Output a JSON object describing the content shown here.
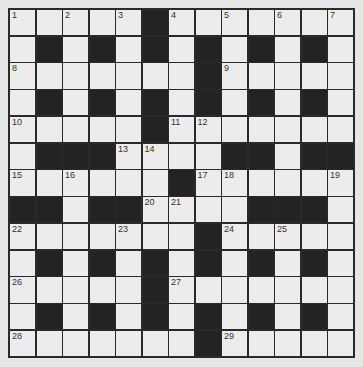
{
  "puzzle": {
    "rows": 13,
    "cols": 13,
    "colors": {
      "white": "#ececec",
      "black": "#232323",
      "border": "#2a2a2a",
      "background": "#e6e6e6"
    },
    "layout": [
      "WWWWWBWWWWWWW",
      "WBWBWBWBWBWBW",
      "WWWWWWWBWWWWW",
      "WBWBWBWBWBWBW",
      "WWWWWBWWWWWWW",
      "WBBBWWWWBBWBB",
      "WWWWWWBWWWWWW",
      "BBWBBWWWWBBBW",
      "WWWWWWWBWWWWW",
      "WBWBWBWBWBWBW",
      "WWWWWBWWWWWWW",
      "WBWBWBWBWBWBW",
      "WWWWWWWBWWWWW"
    ],
    "numbers": [
      {
        "n": "1",
        "r": 0,
        "c": 0
      },
      {
        "n": "2",
        "r": 0,
        "c": 2
      },
      {
        "n": "3",
        "r": 0,
        "c": 4
      },
      {
        "n": "4",
        "r": 0,
        "c": 6
      },
      {
        "n": "5",
        "r": 0,
        "c": 8
      },
      {
        "n": "6",
        "r": 0,
        "c": 10
      },
      {
        "n": "7",
        "r": 0,
        "c": 12
      },
      {
        "n": "8",
        "r": 2,
        "c": 0
      },
      {
        "n": "9",
        "r": 2,
        "c": 8
      },
      {
        "n": "10",
        "r": 4,
        "c": 0
      },
      {
        "n": "11",
        "r": 4,
        "c": 6
      },
      {
        "n": "12",
        "r": 4,
        "c": 7
      },
      {
        "n": "13",
        "r": 5,
        "c": 4
      },
      {
        "n": "14",
        "r": 5,
        "c": 5
      },
      {
        "n": "15",
        "r": 6,
        "c": 0
      },
      {
        "n": "16",
        "r": 6,
        "c": 2
      },
      {
        "n": "17",
        "r": 6,
        "c": 7
      },
      {
        "n": "18",
        "r": 6,
        "c": 8
      },
      {
        "n": "19",
        "r": 6,
        "c": 12
      },
      {
        "n": "20",
        "r": 7,
        "c": 5
      },
      {
        "n": "21",
        "r": 7,
        "c": 6
      },
      {
        "n": "22",
        "r": 8,
        "c": 0
      },
      {
        "n": "23",
        "r": 8,
        "c": 4
      },
      {
        "n": "24",
        "r": 8,
        "c": 8
      },
      {
        "n": "25",
        "r": 8,
        "c": 10
      },
      {
        "n": "26",
        "r": 10,
        "c": 0
      },
      {
        "n": "27",
        "r": 10,
        "c": 6
      },
      {
        "n": "28",
        "r": 12,
        "c": 0
      },
      {
        "n": "29",
        "r": 12,
        "c": 8
      }
    ]
  }
}
